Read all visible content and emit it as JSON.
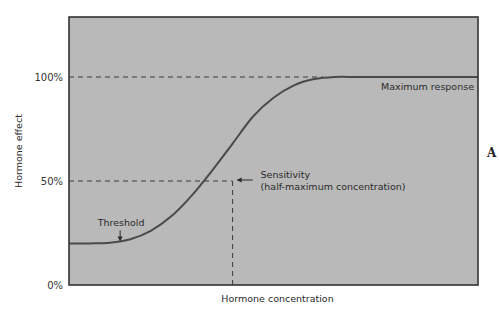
{
  "chart_data": {
    "type": "line",
    "title": "",
    "panel_label": "A",
    "xlabel": "Hormone concentration",
    "ylabel": "Hormone effect",
    "xlim": [
      0,
      100
    ],
    "ylim": [
      0,
      120
    ],
    "y_ticks": [
      {
        "value": 0,
        "label": "0%"
      },
      {
        "value": 50,
        "label": "50%"
      },
      {
        "value": 100,
        "label": "100%"
      }
    ],
    "x_ticks": [],
    "grid": false,
    "plot_background": "#b9b9b9",
    "curve_color": "#4a4a4a",
    "series": [
      {
        "name": "Dose-response curve",
        "x": [
          0,
          5,
          10,
          15,
          20,
          25,
          30,
          35,
          40,
          45,
          50,
          55,
          60,
          65,
          70,
          75,
          80,
          85,
          90,
          95,
          100
        ],
        "y": [
          20,
          20,
          20.3,
          22,
          26,
          33,
          43,
          55,
          68,
          81,
          90,
          96,
          99,
          100,
          100,
          100,
          100,
          100,
          100,
          100,
          100
        ]
      }
    ],
    "reference_lines": [
      {
        "name": "max-response-line",
        "orientation": "horizontal",
        "value": 100,
        "style": "dashed"
      },
      {
        "name": "half-max-line",
        "orientation": "horizontal",
        "value": 50,
        "style": "dashed"
      },
      {
        "name": "sensitivity-line",
        "orientation": "vertical",
        "value": 40,
        "style": "dashed"
      }
    ],
    "annotations": [
      {
        "name": "maximum-response",
        "text": "Maximum response",
        "x": 100,
        "y": 100
      },
      {
        "name": "sensitivity",
        "lines": [
          "Sensitivity",
          "(half-maximum concentration)"
        ],
        "x": 40,
        "y": 50,
        "arrow": "left"
      },
      {
        "name": "threshold",
        "text": "Threshold",
        "x": 12.5,
        "y": 20,
        "arrow": "down"
      }
    ]
  }
}
